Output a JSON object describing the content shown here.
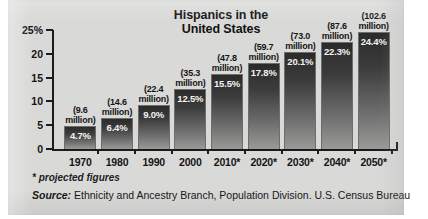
{
  "figure": {
    "title_line1": "Hispanics in the",
    "title_line2": "United States",
    "footnote": "* projected figures",
    "source_prefix": "Source:",
    "source_text": " Ethnicity and Ancestry Branch, Population Division. U.S. Census Bureau",
    "bar_color_top": "#2b2b2b",
    "bar_color_bottom": "#9a9a98",
    "background_color": "#d9d9d7",
    "axis_color": "#1c1c1c"
  },
  "chart_data": {
    "type": "bar",
    "title": "Hispanics in the United States",
    "xlabel": "",
    "ylabel": "",
    "ylim": [
      0,
      25
    ],
    "yticks": [
      "0",
      "5",
      "10",
      "15",
      "20",
      "25%"
    ],
    "ytick_values": [
      0,
      5,
      10,
      15,
      20,
      25
    ],
    "grid": false,
    "legend": "none",
    "categories": [
      "1970",
      "1980",
      "1990",
      "2000",
      "2010*",
      "2020*",
      "2030*",
      "2040*",
      "2050*"
    ],
    "values": [
      4.7,
      6.4,
      9.0,
      12.5,
      15.5,
      17.8,
      20.1,
      22.3,
      24.4
    ],
    "value_labels": [
      "4.7%",
      "6.4%",
      "9.0%",
      "12.5%",
      "15.5%",
      "17.8%",
      "20.1%",
      "22.3%",
      "24.4%"
    ],
    "annotations": [
      {
        "line1": "(9.6",
        "line2": "million)"
      },
      {
        "line1": "(14.6",
        "line2": "million)"
      },
      {
        "line1": "(22.4",
        "line2": "million)"
      },
      {
        "line1": "(35.3",
        "line2": "million)"
      },
      {
        "line1": "(47.8",
        "line2": "million)"
      },
      {
        "line1": "(59.7",
        "line2": "million)"
      },
      {
        "line1": "(73.0",
        "line2": "million)"
      },
      {
        "line1": "(87.6",
        "line2": "million)"
      },
      {
        "line1": "(102.6",
        "line2": "million)"
      }
    ],
    "population_millions": [
      9.6,
      14.6,
      22.4,
      35.3,
      47.8,
      59.7,
      73.0,
      87.6,
      102.6
    ],
    "note": "* projected figures",
    "source": "Source: Ethnicity and Ancestry Branch, Population Division. U.S. Census Bureau"
  }
}
